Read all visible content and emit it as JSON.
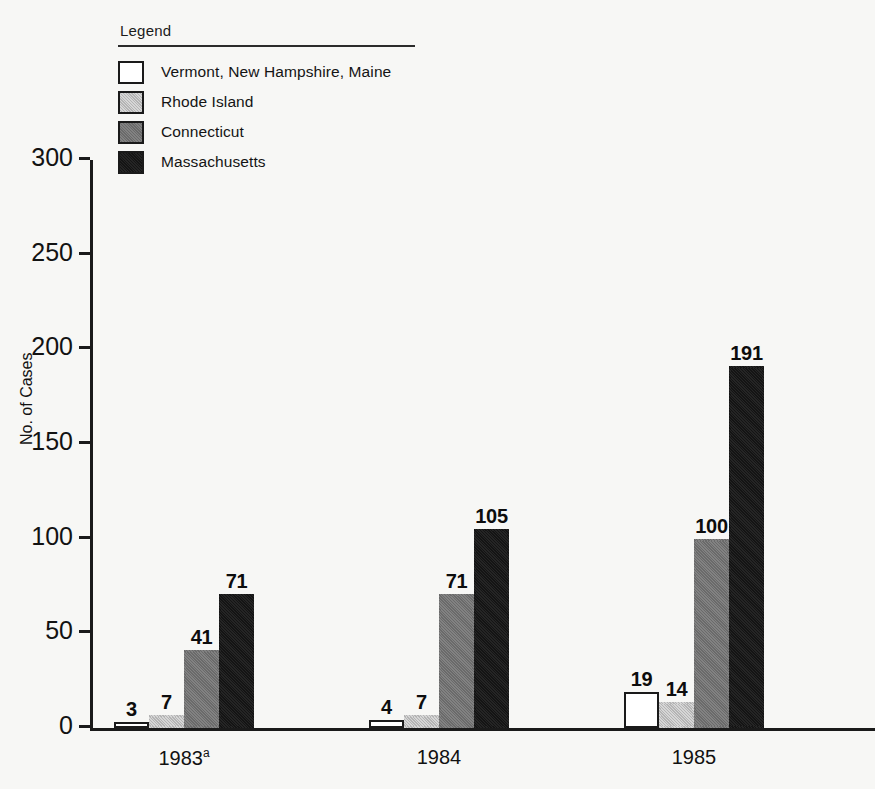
{
  "legend": {
    "title": "Legend",
    "items": [
      {
        "label": "Vermont, New Hampshire, Maine",
        "key": "vt_nh_me",
        "swatch": "white"
      },
      {
        "label": "Rhode Island",
        "key": "rhode_island",
        "swatch": "light-gray"
      },
      {
        "label": "Connecticut",
        "key": "connecticut",
        "swatch": "mid-gray"
      },
      {
        "label": "Massachusetts",
        "key": "massachusetts",
        "swatch": "black"
      }
    ]
  },
  "axes": {
    "ylabel": "No. of Cases",
    "yticks": [
      "0",
      "50",
      "100",
      "150",
      "200",
      "250",
      "300"
    ],
    "xticks": [
      {
        "text": "1983",
        "sup": "a"
      },
      {
        "text": "1984",
        "sup": ""
      },
      {
        "text": "1985",
        "sup": ""
      },
      {
        "text": "1986",
        "sup": ""
      },
      {
        "text": "1987",
        "sup": "b"
      }
    ]
  },
  "colors": {
    "vt_nh_me": "#ffffff",
    "rhode_island": "#b4b4b4",
    "connecticut": "#6a6a6a",
    "massachusetts": "#141414",
    "axis": "#1a1a1a",
    "text": "#111111",
    "background": "#f7f7f5"
  },
  "chart_data": {
    "type": "bar",
    "title": "",
    "xlabel": "",
    "ylabel": "No. of Cases",
    "ylim": [
      0,
      300
    ],
    "ytick_step": 50,
    "grid": false,
    "legend_position": "top-left",
    "categories": [
      "1983a",
      "1984",
      "1985",
      "1986",
      "1987b"
    ],
    "series": [
      {
        "name": "Vermont, New Hampshire, Maine",
        "values": [
          3,
          4,
          19,
          53,
          25
        ]
      },
      {
        "name": "Rhode Island",
        "values": [
          7,
          7,
          14,
          39,
          35
        ]
      },
      {
        "name": "Connecticut",
        "values": [
          41,
          71,
          100,
          167,
          65
        ]
      },
      {
        "name": "Massachusetts",
        "values": [
          71,
          105,
          191,
          287,
          171
        ]
      }
    ],
    "annotations": [
      "a = footnote marker on 1983",
      "b = footnote marker on 1987"
    ]
  }
}
